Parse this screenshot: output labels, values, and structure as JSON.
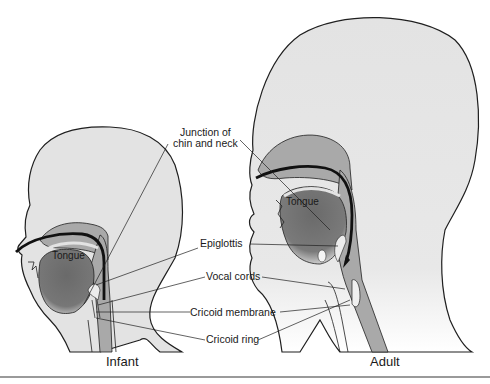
{
  "figure": {
    "labels": {
      "junction": [
        "Junction of",
        "chin and neck"
      ],
      "epiglottis": "Epiglottis",
      "vocal_cords": "Vocal cords",
      "cricoid_membrane": "Cricoid membrane",
      "cricoid_ring": "Cricoid ring"
    },
    "infant": {
      "caption": "Infant",
      "tongue": "Tongue"
    },
    "adult": {
      "caption": "Adult",
      "tongue": "Tongue"
    },
    "colors": {
      "skin": "#e3e3e3",
      "airway_mid": "#a9a9a9",
      "tongue": "#6e6e6e",
      "outline": "#1f1f1f",
      "rule": "#9a9a9a"
    }
  }
}
